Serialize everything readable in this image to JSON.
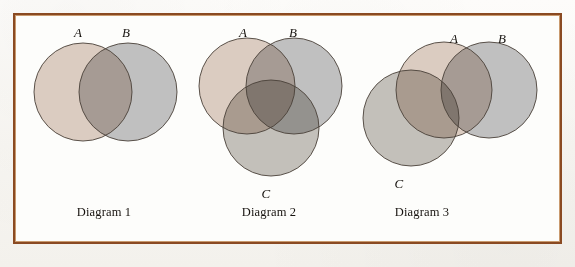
{
  "figure": {
    "frame": {
      "border_color": "#8a4a22",
      "inner_rule_color": "#c99a6e",
      "background": "#fdfdfb"
    },
    "page_background": "#fbfaf7",
    "stroke_color": "#4a4139"
  },
  "palette": {
    "set_a_fill": "#d8c7bc",
    "set_b_fill": "#b9babb",
    "set_c_fill": "#bdbab4",
    "intersection_ab": "#8b817b",
    "intersection_ac": "#a1887c",
    "intersection_bc": "#8d8881",
    "intersection_abc": "#6b5c54",
    "outline": "#4a4139"
  },
  "chart_data": {
    "type": "diagram",
    "subtype": "venn",
    "title": "",
    "panels": [
      {
        "caption": "Diagram 1",
        "caption_position": {
          "x": 104,
          "y": 212
        },
        "sets": [
          "A",
          "B"
        ],
        "relations": [
          {
            "sets": [
              "A",
              "B"
            ],
            "type": "overlap"
          }
        ],
        "circles": [
          {
            "set": "A",
            "cx": 83,
            "cy": 92,
            "r": 49,
            "fill": "#d8c7bc",
            "label": "A",
            "label_x": 78,
            "label_y": 33
          },
          {
            "set": "B",
            "cx": 128,
            "cy": 92,
            "r": 49,
            "fill": "#b9babb",
            "label": "B",
            "label_x": 126,
            "label_y": 33
          }
        ]
      },
      {
        "caption": "Diagram 2",
        "caption_position": {
          "x": 269,
          "y": 212
        },
        "sets": [
          "A",
          "B",
          "C"
        ],
        "relations": [
          {
            "sets": [
              "A",
              "B"
            ],
            "type": "overlap"
          },
          {
            "sets": [
              "A",
              "C"
            ],
            "type": "overlap"
          },
          {
            "sets": [
              "B",
              "C"
            ],
            "type": "overlap"
          },
          {
            "sets": [
              "A",
              "B",
              "C"
            ],
            "type": "overlap"
          }
        ],
        "circles": [
          {
            "set": "A",
            "cx": 247,
            "cy": 86,
            "r": 48,
            "fill": "#d8c7bc",
            "label": "A",
            "label_x": 243,
            "label_y": 33
          },
          {
            "set": "B",
            "cx": 294,
            "cy": 86,
            "r": 48,
            "fill": "#b9babb",
            "label": "B",
            "label_x": 293,
            "label_y": 33
          },
          {
            "set": "C",
            "cx": 271,
            "cy": 128,
            "r": 48,
            "fill": "#bdbab4",
            "label": "C",
            "label_x": 266,
            "label_y": 194
          }
        ]
      },
      {
        "caption": "Diagram 3",
        "caption_position": {
          "x": 422,
          "y": 212
        },
        "sets": [
          "A",
          "B",
          "C"
        ],
        "relations": [
          {
            "sets": [
              "A",
              "B"
            ],
            "type": "overlap"
          },
          {
            "sets": [
              "A",
              "C"
            ],
            "type": "overlap"
          },
          {
            "sets": [
              "B",
              "C"
            ],
            "type": "disjoint"
          }
        ],
        "circles": [
          {
            "set": "A",
            "cx": 444,
            "cy": 90,
            "r": 48,
            "fill": "#d8c7bc",
            "label": "A",
            "label_x": 454,
            "label_y": 39
          },
          {
            "set": "B",
            "cx": 489,
            "cy": 90,
            "r": 48,
            "fill": "#b9babb",
            "label": "B",
            "label_x": 502,
            "label_y": 39
          },
          {
            "set": "C",
            "cx": 411,
            "cy": 118,
            "r": 48,
            "fill": "#bdbab4",
            "label": "C",
            "label_x": 399,
            "label_y": 184
          }
        ]
      }
    ]
  }
}
